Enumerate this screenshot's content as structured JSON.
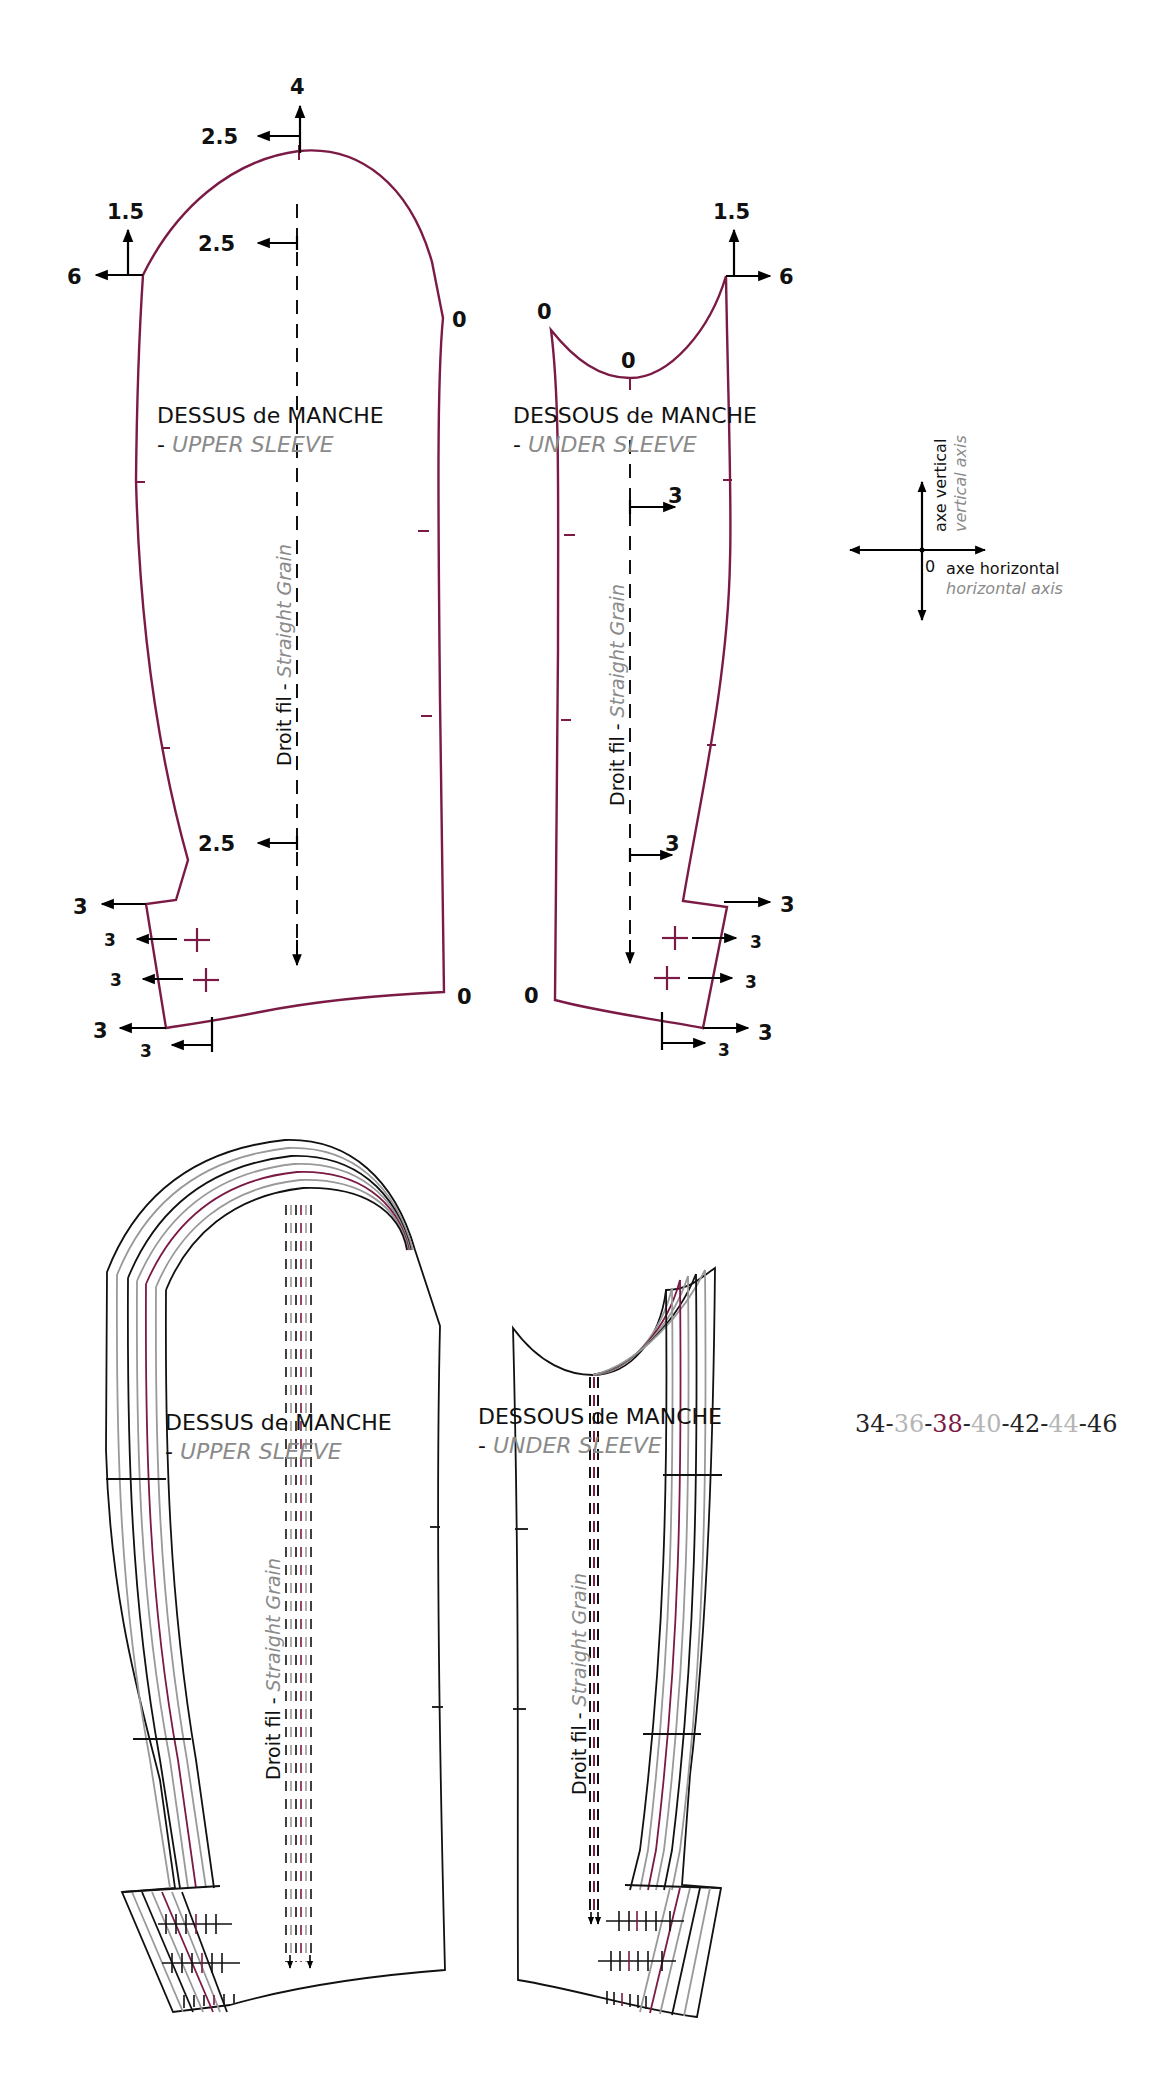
{
  "colors": {
    "pattern_line": "#7b1a45",
    "annotation": "#111111",
    "english_text": "#8a8a8a",
    "size_black": "#222222",
    "size_gray": "#b5b5b5",
    "size_highlight": "#7b1a45"
  },
  "upper_sleeve": {
    "title_fr": "DESSUS de MANCHE",
    "title_en_prefix": "- ",
    "title_en": "UPPER SLEEVE",
    "grain_fr": "Droit fil",
    "grain_sep": " - ",
    "grain_en": "Straight Grain",
    "grading": {
      "cap_top_up": "4",
      "cap_top_left": "2.5",
      "grain_top_left": "2.5",
      "front_corner_up": "1.5",
      "front_corner_left": "6",
      "back_corner": "0",
      "grain_bottom_left": "2.5",
      "elbow_left": "3",
      "notch1_left": "3",
      "notch2_left": "3",
      "hem_corner_left": "3",
      "hem_notch_left": "3",
      "hem_back": "0"
    }
  },
  "under_sleeve": {
    "title_fr": "DESSOUS  de MANCHE",
    "title_en_prefix": "- ",
    "title_en": "UNDER SLEEVE",
    "grain_fr": "Droit fil",
    "grain_sep": " - ",
    "grain_en": "Straight Grain",
    "grading": {
      "back_top": "0",
      "cap_low": "0",
      "front_corner_up": "1.5",
      "front_corner_right": "6",
      "grain_top_right": "3",
      "grain_bottom_right": "3",
      "elbow_right": "3",
      "notch1_right": "3",
      "notch2_right": "3",
      "hem_corner_right": "3",
      "hem_notch_right": "3",
      "hem_back": "0"
    }
  },
  "axis_legend": {
    "origin": "0",
    "vertical_fr": "axe vertical",
    "vertical_en": "vertical axis",
    "horizontal_fr": "axe horizontal",
    "horizontal_en": "horizontal axis"
  },
  "size_range": {
    "sizes": [
      "34",
      "36",
      "38",
      "40",
      "42",
      "44",
      "46"
    ],
    "separator": "-",
    "size_colors": [
      "#222222",
      "#b5b5b5",
      "#7b1a45",
      "#b5b5b5",
      "#222222",
      "#b5b5b5",
      "#222222"
    ]
  },
  "graded_upper_sleeve": {
    "title_fr": "DESSUS de MANCHE",
    "title_en_prefix": "- ",
    "title_en": "UPPER SLEEVE",
    "grain_fr": "Droit fil",
    "grain_sep": " - ",
    "grain_en": "Straight Grain"
  },
  "graded_under_sleeve": {
    "title_fr": "DESSOUS  de MANCHE",
    "title_en_prefix": "- ",
    "title_en": "UNDER SLEEVE",
    "grain_fr": "Droit fil",
    "grain_sep": " - ",
    "grain_en": "Straight Grain"
  }
}
